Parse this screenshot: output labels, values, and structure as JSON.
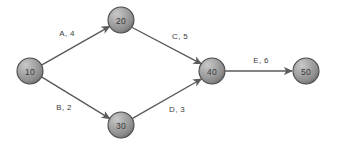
{
  "diagram": {
    "type": "activity-on-arrow-network-diagram",
    "background_color": "#ffffff",
    "node_fill_color": "#9a9a9a",
    "node_stroke_color": "#4a4a4a",
    "edge_color": "#5a5a5a",
    "label_color": "#3c3c3c",
    "nodes": [
      {
        "id": "n10",
        "label": "10",
        "cx": 30,
        "cy": 71,
        "r": 13
      },
      {
        "id": "n20",
        "label": "20",
        "cx": 121,
        "cy": 20,
        "r": 13
      },
      {
        "id": "n30",
        "label": "30",
        "cx": 121,
        "cy": 125,
        "r": 13
      },
      {
        "id": "n40",
        "label": "40",
        "cx": 212,
        "cy": 71,
        "r": 13
      },
      {
        "id": "n50",
        "label": "50",
        "cx": 306,
        "cy": 71,
        "r": 13
      }
    ],
    "edges": [
      {
        "id": "eA",
        "activity": "A",
        "duration": 4,
        "label": "A, 4",
        "from": "10",
        "to": "20",
        "label_x": 67,
        "label_y": 33
      },
      {
        "id": "eB",
        "activity": "B",
        "duration": 2,
        "label": "B, 2",
        "from": "10",
        "to": "30",
        "label_x": 64,
        "label_y": 107
      },
      {
        "id": "eC",
        "activity": "C",
        "duration": 5,
        "label": "C, 5",
        "from": "20",
        "to": "40",
        "label_x": 180,
        "label_y": 36
      },
      {
        "id": "eD",
        "activity": "D",
        "duration": 3,
        "label": "D, 3",
        "from": "30",
        "to": "40",
        "label_x": 177,
        "label_y": 109
      },
      {
        "id": "eE",
        "activity": "E",
        "duration": 6,
        "label": "E, 6",
        "from": "40",
        "to": "50",
        "label_x": 261,
        "label_y": 60
      }
    ]
  }
}
